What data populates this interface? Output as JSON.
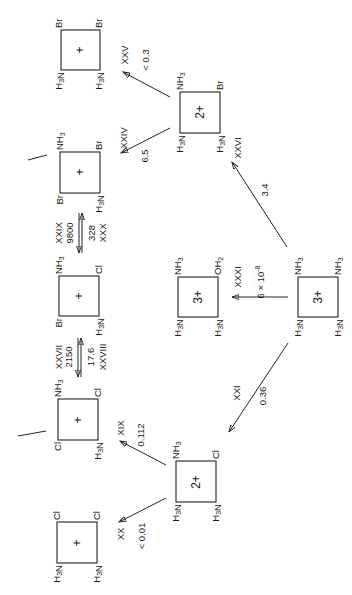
{
  "diagram": {
    "orientation": "rotated 90deg counter-clockwise",
    "complexes": [
      {
        "id": "c_br_br",
        "charge": "+",
        "ligands": {
          "top_left": "Br",
          "top_right": "Br",
          "bottom_left": "H3N",
          "bottom_right": "H3N"
        }
      },
      {
        "id": "c_nh3_br",
        "charge": "+",
        "ligands": {
          "top_left": "NH3",
          "top_right": "Br",
          "bottom_left": "Br",
          "bottom_right": "H3N"
        }
      },
      {
        "id": "c_nh3_cl_br",
        "charge": "+",
        "ligands": {
          "top_left": "NH3",
          "top_right": "Cl",
          "bottom_left": "Br",
          "bottom_right": "H3N"
        }
      },
      {
        "id": "c_nh3_cl_cl",
        "charge": "+",
        "ligands": {
          "top_left": "NH3",
          "top_right": "Cl",
          "bottom_left": "Cl",
          "bottom_right": "H3N"
        }
      },
      {
        "id": "c_cl_cl",
        "charge": "+",
        "ligands": {
          "top_left": "Cl",
          "top_right": "Cl",
          "bottom_left": "H3N",
          "bottom_right": "H3N"
        }
      },
      {
        "id": "c_2plus_br",
        "charge": "2+",
        "ligands": {
          "top_left": "NH3",
          "top_right": "Br",
          "bottom_left": "H3N",
          "bottom_right": "H3N"
        }
      },
      {
        "id": "c_3plus_oh2",
        "charge": "3+",
        "ligands": {
          "top_left": "NH3",
          "top_right": "OH2",
          "bottom_left": "H3N",
          "bottom_right": "H3N"
        }
      },
      {
        "id": "c_3plus_main",
        "charge": "3+",
        "ligands": {
          "top_left": "NH3",
          "top_right": "NH3",
          "bottom_left": "H3N",
          "bottom_right": "H3N"
        }
      },
      {
        "id": "c_2plus_cl",
        "charge": "2+",
        "ligands": {
          "top_left": "NH3",
          "top_right": "Cl",
          "bottom_left": "H3N",
          "bottom_right": "H3N"
        }
      }
    ],
    "reactions": [
      {
        "label": "XXV",
        "rate": "< 0.3"
      },
      {
        "label": "XXIV",
        "rate": "6.5"
      },
      {
        "label": "XXVI",
        "rate": "3.4"
      },
      {
        "label": "XXIX",
        "rate": "9800"
      },
      {
        "label": "XXX",
        "rate": "328"
      },
      {
        "label": "XXVII",
        "rate": "2150"
      },
      {
        "label": "XXVIII",
        "rate": "17.6"
      },
      {
        "label": "XXXI",
        "rate": "6 × 10",
        "rate_exp": "-8"
      },
      {
        "label": "XXI",
        "rate": "0.36"
      },
      {
        "label": "XIX",
        "rate": "0.112"
      },
      {
        "label": "XX",
        "rate": "< 0.01"
      }
    ]
  }
}
